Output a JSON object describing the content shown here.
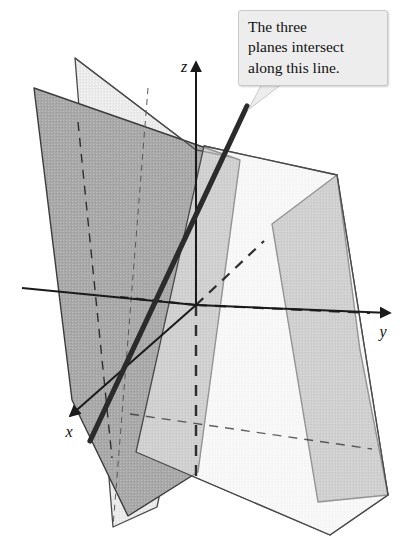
{
  "figure": {
    "background_color": "#ffffff",
    "width": 405,
    "height": 556
  },
  "callout": {
    "name": "callout-annotation",
    "text": "The three\nplanes intersect\nalong this line.",
    "lines": [
      "The three",
      "planes intersect",
      "along this line."
    ],
    "fill_color": "#ededed",
    "border_color": "#c9c9c9",
    "text_color": "#111111",
    "tail_target": "intersection-line"
  },
  "axes": [
    {
      "name": "x-axis",
      "label": "x",
      "label_x": 70,
      "label_y": 436,
      "direction": "down-left",
      "arrow": true,
      "style": "solid",
      "from": [
        196,
        305
      ],
      "to": [
        68,
        418
      ]
    },
    {
      "name": "y-axis",
      "label": "y",
      "label_x": 380,
      "label_y": 336,
      "direction": "right",
      "arrow": true,
      "style": "solid",
      "from": [
        196,
        305
      ],
      "to": [
        392,
        313
      ]
    },
    {
      "name": "z-axis",
      "label": "z",
      "label_x": 183,
      "label_y": 72,
      "direction": "up",
      "arrow": true,
      "style": "solid",
      "from": [
        196,
        305
      ],
      "to": [
        196,
        60
      ]
    }
  ],
  "origin": {
    "name": "origin",
    "x": 196,
    "y": 305
  },
  "planes": [
    {
      "name": "plane-front-left",
      "shade": "dark",
      "fill_color": "#a9a9a9",
      "stroke_color": "#3c3c3c",
      "points": "34,88 206,148 240,160 198,472 128,516 72,400"
    },
    {
      "name": "plane-back-light",
      "shade": "light",
      "fill_color": "#e3e3e3",
      "stroke_color": "#4a4a4a",
      "points": "75,58 196,150 231,157 157,507 113,527"
    },
    {
      "name": "plane-right-dark",
      "shade": "dark",
      "fill_color": "#a9a9a9",
      "stroke_color": "#3c3c3c",
      "points": "272,224 337,175 360,350 388,495 318,502"
    },
    {
      "name": "plane-wide-light",
      "shade": "light",
      "fill_color": "#efefef",
      "stroke_color": "#4a4a4a",
      "points": "204,146 337,175 388,495 330,535 136,452"
    }
  ],
  "intersection_line": {
    "name": "intersection-line",
    "description": "thick line where the three planes meet",
    "color": "#2b2b2b",
    "width": 5,
    "from": [
      247,
      106
    ],
    "to": [
      90,
      441
    ]
  },
  "hidden_edges": [
    {
      "name": "hidden-edge-plane-front-left",
      "style": "dashed",
      "from": [
        78,
        122
      ],
      "to": [
        112,
        458
      ]
    },
    {
      "name": "hidden-edge-z-below-origin",
      "style": "dashed",
      "from": [
        196,
        305
      ],
      "to": [
        196,
        478
      ]
    },
    {
      "name": "hidden-edge-y-left",
      "style": "dashed",
      "from": [
        196,
        305
      ],
      "to": [
        120,
        297
      ]
    },
    {
      "name": "hidden-edge-diagonal",
      "style": "dashed",
      "from": [
        196,
        305
      ],
      "to": [
        262,
        243
      ]
    },
    {
      "name": "hidden-edge-base-right",
      "style": "dashed",
      "from": [
        196,
        305
      ],
      "to": [
        368,
        312
      ]
    },
    {
      "name": "hidden-edge-bottom-horizontal",
      "style": "dashed",
      "from": [
        128,
        415
      ],
      "to": [
        364,
        447
      ]
    },
    {
      "name": "hidden-edge-bottom-vertical",
      "style": "dashed",
      "from": [
        196,
        390
      ],
      "to": [
        196,
        478
      ]
    }
  ],
  "colors": {
    "plane_dark": "#a9a9a9",
    "plane_light": "#e9e9e9",
    "line_dark": "#2b2b2b",
    "stroke": "#3c3c3c",
    "background": "#ffffff"
  }
}
